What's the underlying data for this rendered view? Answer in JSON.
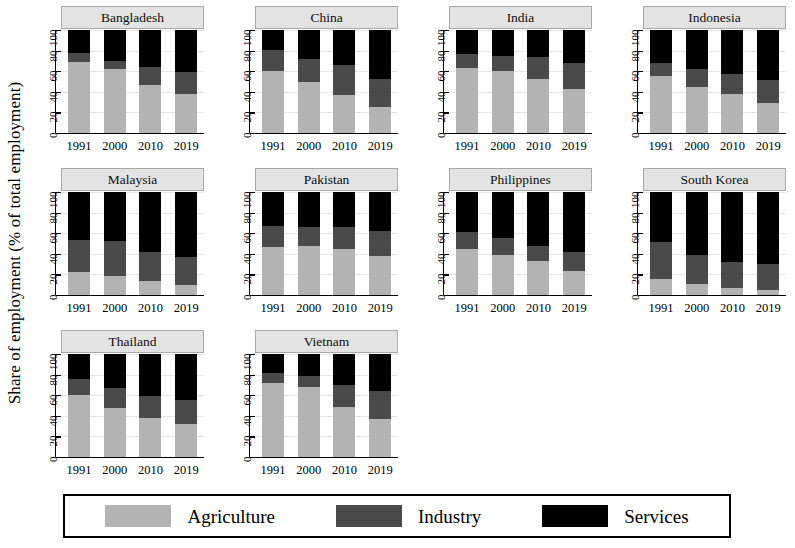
{
  "chart_data": {
    "type": "bar",
    "title": "",
    "subtitle": "",
    "xlabel": "",
    "ylabel": "Share of employment (% of total employment)",
    "stacked": true,
    "stack_total": 100,
    "grid": true,
    "legend_position": "bottom",
    "ylim": [
      0,
      100
    ],
    "yticks": [
      0,
      20,
      40,
      60,
      80,
      100
    ],
    "ytick_labels": [
      "0",
      "20",
      "40",
      "60",
      "80",
      "100"
    ],
    "categories": [
      "1991",
      "2000",
      "2010",
      "2019"
    ],
    "series_names": [
      "Agriculture",
      "Industry",
      "Services"
    ],
    "series_colors": [
      "#b3b3b3",
      "#4a4a4a",
      "#000000"
    ],
    "panel_layout": {
      "rows": 3,
      "cols": 4,
      "panels_in_last_row": 2
    },
    "panels": [
      {
        "name": "Bangladesh",
        "series": [
          {
            "name": "Agriculture",
            "values": [
              69,
              62,
              47,
              38
            ]
          },
          {
            "name": "Industry",
            "values": [
              9,
              8,
              17,
              21
            ]
          },
          {
            "name": "Services",
            "values": [
              22,
              30,
              36,
              41
            ]
          }
        ]
      },
      {
        "name": "China",
        "series": [
          {
            "name": "Agriculture",
            "values": [
              60,
              50,
              37,
              25
            ]
          },
          {
            "name": "Industry",
            "values": [
              21,
              22,
              29,
              27
            ]
          },
          {
            "name": "Services",
            "values": [
              19,
              28,
              34,
              48
            ]
          }
        ]
      },
      {
        "name": "India",
        "series": [
          {
            "name": "Agriculture",
            "values": [
              63,
              60,
              52,
              43
            ]
          },
          {
            "name": "Industry",
            "values": [
              14,
              15,
              22,
              25
            ]
          },
          {
            "name": "Services",
            "values": [
              23,
              25,
              26,
              32
            ]
          }
        ]
      },
      {
        "name": "Indonesia",
        "series": [
          {
            "name": "Agriculture",
            "values": [
              55,
              45,
              38,
              29
            ]
          },
          {
            "name": "Industry",
            "values": [
              13,
              17,
              19,
              22
            ]
          },
          {
            "name": "Services",
            "values": [
              32,
              38,
              43,
              49
            ]
          }
        ]
      },
      {
        "name": "Malaysia",
        "series": [
          {
            "name": "Agriculture",
            "values": [
              22,
              18,
              14,
              10
            ]
          },
          {
            "name": "Industry",
            "values": [
              31,
              34,
              28,
              27
            ]
          },
          {
            "name": "Services",
            "values": [
              47,
              48,
              58,
              63
            ]
          }
        ]
      },
      {
        "name": "Pakistan",
        "series": [
          {
            "name": "Agriculture",
            "values": [
              47,
              48,
              45,
              38
            ]
          },
          {
            "name": "Industry",
            "values": [
              20,
              18,
              21,
              24
            ]
          },
          {
            "name": "Services",
            "values": [
              33,
              34,
              34,
              38
            ]
          }
        ]
      },
      {
        "name": "Philippines",
        "series": [
          {
            "name": "Agriculture",
            "values": [
              45,
              39,
              33,
              23
            ]
          },
          {
            "name": "Industry",
            "values": [
              16,
              16,
              15,
              19
            ]
          },
          {
            "name": "Services",
            "values": [
              39,
              45,
              52,
              58
            ]
          }
        ]
      },
      {
        "name": "South Korea",
        "series": [
          {
            "name": "Agriculture",
            "values": [
              16,
              11,
              7,
              5
            ]
          },
          {
            "name": "Industry",
            "values": [
              35,
              28,
              25,
              25
            ]
          },
          {
            "name": "Services",
            "values": [
              49,
              61,
              68,
              70
            ]
          }
        ]
      },
      {
        "name": "Thailand",
        "series": [
          {
            "name": "Agriculture",
            "values": [
              60,
              48,
              38,
              32
            ]
          },
          {
            "name": "Industry",
            "values": [
              16,
              19,
              21,
              23
            ]
          },
          {
            "name": "Services",
            "values": [
              24,
              33,
              41,
              45
            ]
          }
        ]
      },
      {
        "name": "Vietnam",
        "series": [
          {
            "name": "Agriculture",
            "values": [
              72,
              68,
              49,
              37
            ]
          },
          {
            "name": "Industry",
            "values": [
              10,
              11,
              21,
              27
            ]
          },
          {
            "name": "Services",
            "values": [
              18,
              21,
              30,
              36
            ]
          }
        ]
      }
    ]
  },
  "legend": {
    "items": [
      {
        "label": "Agriculture",
        "color": "#b3b3b3",
        "swatch_name": "legend-swatch-agriculture"
      },
      {
        "label": "Industry",
        "color": "#4a4a4a",
        "swatch_name": "legend-swatch-industry"
      },
      {
        "label": "Services",
        "color": "#000000",
        "swatch_name": "legend-swatch-services"
      }
    ]
  }
}
